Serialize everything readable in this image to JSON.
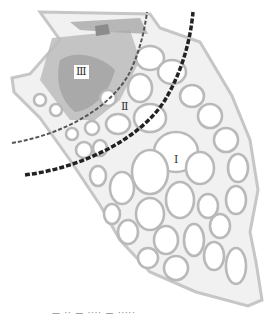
{
  "figure": {
    "type": "anatomical-diagram",
    "zones": [
      {
        "id": "zone-3",
        "label": "Ⅲ"
      },
      {
        "id": "zone-2",
        "label": "Ⅱ"
      },
      {
        "id": "zone-1",
        "label": "Ⅰ"
      }
    ],
    "boundaries": [
      {
        "id": "inner-boundary",
        "style": "thin dashed",
        "color": "#555555"
      },
      {
        "id": "outer-boundary",
        "style": "thick dashed",
        "color": "#222222"
      }
    ],
    "colors": {
      "tissue": "#c8c8c8",
      "vessel": "#b4b4b4",
      "dense_region": "#9a9a9a",
      "background": "#ffffff"
    },
    "caption": "—  ·· —  ····  —  ·····"
  }
}
